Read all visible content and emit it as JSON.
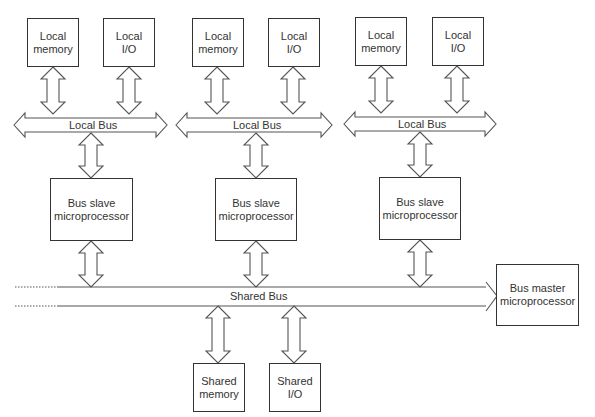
{
  "diagram": {
    "nodes": {
      "groups": [
        {
          "local_memory": "Local memory",
          "local_io": "Local I/O",
          "local_bus": "Local Bus",
          "slave": "Bus slave microprocessor"
        },
        {
          "local_memory": "Local memory",
          "local_io": "Local I/O",
          "local_bus": "Local Bus",
          "slave": "Bus slave microprocessor"
        },
        {
          "local_memory": "Local memory",
          "local_io": "Local I/O",
          "local_bus": "Local Bus",
          "slave": "Bus slave microprocessor"
        }
      ],
      "shared_bus": "Shared Bus",
      "bus_master": "Bus master microprocessor",
      "shared_memory": "Shared memory",
      "shared_io": "Shared I/O"
    },
    "edges": [
      "Local memory <-> Local Bus (x3)",
      "Local I/O <-> Local Bus (x3)",
      "Local Bus <-> Bus slave microprocessor (x3)",
      "Bus slave microprocessor <-> Shared Bus (x3)",
      "Shared Bus -> Bus master microprocessor",
      "Shared Bus <-> Shared memory",
      "Shared Bus <-> Shared I/O"
    ],
    "colors": {
      "stroke": "#555555",
      "text": "#333333",
      "background": "#ffffff"
    }
  }
}
